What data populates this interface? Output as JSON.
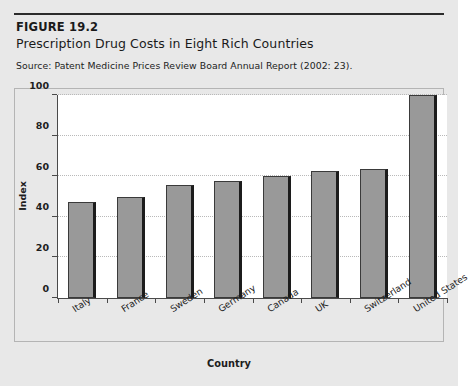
{
  "figure": {
    "label": "FIGURE 19.2",
    "title": "Prescription Drug Costs in Eight Rich Countries",
    "source": "Source: Patent Medicine Prices Review Board Annual Report (2002: 23)."
  },
  "chart_data": {
    "type": "bar",
    "title": "Prescription Drug Costs in Eight Rich Countries",
    "xlabel": "Country",
    "ylabel": "Index",
    "categories": [
      "Italy",
      "France",
      "Sweden",
      "Germany",
      "Canada",
      "UK",
      "Switzerland",
      "United States"
    ],
    "values": [
      47.5,
      50,
      55.5,
      57.5,
      60,
      62.5,
      63.5,
      100
    ],
    "ylim": [
      0,
      100
    ],
    "yticks": [
      0,
      20,
      40,
      60,
      80,
      100
    ],
    "ytick_labels": [
      "0",
      "20",
      "40",
      "60",
      "80",
      "100"
    ],
    "grid": true,
    "legend": false,
    "bar_color": "#999999",
    "bar_edge_color": "#3a3a3a",
    "plot_background": "#ffffff",
    "page_background": "#e8e8e8"
  }
}
